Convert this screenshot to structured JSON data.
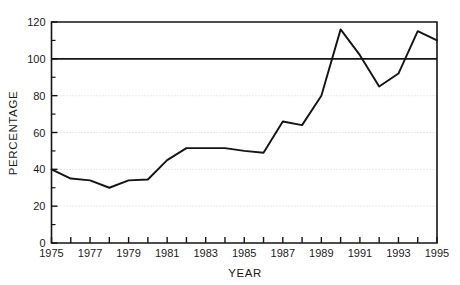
{
  "chart_data": {
    "type": "line",
    "title": "",
    "xlabel": "YEAR",
    "ylabel": "PERCENTAGE",
    "xlim": [
      1975,
      1995
    ],
    "ylim": [
      0,
      120
    ],
    "grid": "horizontal dotted gridlines at 20, 40, 60, 80",
    "legend": "none",
    "x": [
      1975,
      1976,
      1977,
      1978,
      1979,
      1980,
      1981,
      1982,
      1983,
      1984,
      1985,
      1986,
      1987,
      1988,
      1989,
      1990,
      1991,
      1992,
      1993,
      1994,
      1995
    ],
    "values": [
      40,
      35,
      34,
      30,
      34,
      34.5,
      45,
      51.5,
      51.5,
      51.5,
      50,
      49,
      66,
      64,
      80,
      116,
      102,
      85,
      92,
      115,
      110
    ],
    "series": [
      {
        "name": "percentage",
        "values": [
          40,
          35,
          34,
          30,
          34,
          34.5,
          45,
          51.5,
          51.5,
          51.5,
          50,
          49,
          66,
          64,
          80,
          116,
          102,
          85,
          92,
          115,
          110
        ]
      }
    ],
    "reference_lines": [
      {
        "name": "100-percent-line",
        "orientation": "horizontal",
        "value": 100
      }
    ],
    "y_ticks": [
      0,
      20,
      40,
      60,
      80,
      100,
      120
    ],
    "y_tick_labels": [
      "0",
      "20",
      "40",
      "60",
      "80",
      "100",
      "120"
    ],
    "y_minor_ticks": [
      10,
      30,
      50,
      70,
      90,
      110
    ],
    "x_ticks": [
      1975,
      1976,
      1977,
      1978,
      1979,
      1980,
      1981,
      1982,
      1983,
      1984,
      1985,
      1986,
      1987,
      1988,
      1989,
      1990,
      1991,
      1992,
      1993,
      1994,
      1995
    ],
    "x_tick_labels": [
      "1975",
      "",
      "1977",
      "",
      "1979",
      "",
      "1981",
      "",
      "1983",
      "",
      "1985",
      "",
      "1987",
      "",
      "1989",
      "",
      "1991",
      "",
      "1993",
      "",
      "1995"
    ],
    "colors": {
      "line": "#141414",
      "reference_line": "#141414",
      "axis": "#141414",
      "grid": "#cfcfcf",
      "background": "#ffffff"
    }
  },
  "artifact": {
    "top_clipped_text": ""
  }
}
